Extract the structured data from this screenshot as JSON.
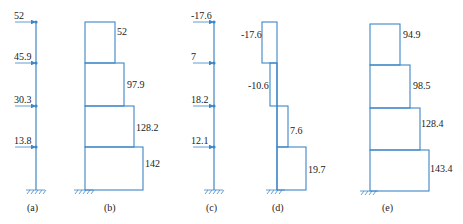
{
  "colors": {
    "line": "#3d86c6",
    "text": "#222222"
  },
  "panels": {
    "a": {
      "caption": "(a)",
      "loads": [
        "52",
        "45.9",
        "30.3",
        "13.8"
      ]
    },
    "b": {
      "caption": "(b)",
      "values": [
        "52",
        "97.9",
        "128.2",
        "142"
      ]
    },
    "c": {
      "caption": "(c)",
      "loads": [
        "-17.6",
        "7",
        "18.2",
        "12.1"
      ]
    },
    "d": {
      "caption": "(d)",
      "values": [
        "-17.6",
        "-10.6",
        "7.6",
        "19.7"
      ]
    },
    "e": {
      "caption": "(e)",
      "values": [
        "94.9",
        "98.5",
        "128.4",
        "143.4"
      ]
    }
  }
}
